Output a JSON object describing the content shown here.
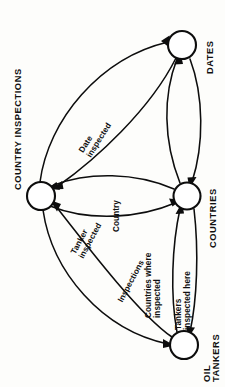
{
  "figure": {
    "orientation": "rotated-90-ccw",
    "type": "entity-relationship-network-diagram",
    "background_color": "#fdfdfb",
    "ink_color": "#0d0d0d"
  },
  "nodes": [
    {
      "id": "country-inspections",
      "label": "COUNTRY INSPECTIONS",
      "lines": [
        "COUNTRY INSPECTIONS"
      ],
      "cx": 41,
      "cy": 196,
      "r": 14
    },
    {
      "id": "dates",
      "label": "DATES",
      "lines": [
        "DATES"
      ],
      "cx": 182,
      "cy": 45,
      "r": 14
    },
    {
      "id": "countries",
      "label": "COUNTRIES",
      "lines": [
        "COUNTRIES"
      ],
      "cx": 187,
      "cy": 196,
      "r": 13.5
    },
    {
      "id": "oil-tankers",
      "label": "OIL TANKERS",
      "lines": [
        "OIL",
        "TANKERS"
      ],
      "cx": 184,
      "cy": 345,
      "r": 14
    }
  ],
  "edges": [
    {
      "id": "date-inspected",
      "label": "Date inspected",
      "lines": [
        "Date",
        "inspected"
      ],
      "from": "country-inspections",
      "to": "dates"
    },
    {
      "id": "inspections-dates",
      "label": "Inspections",
      "lines": [
        "Inspections"
      ],
      "from": "dates",
      "to": "country-inspections"
    },
    {
      "id": "country",
      "label": "Country",
      "lines": [
        "Country"
      ],
      "from": "country-inspections",
      "to": "countries"
    },
    {
      "id": "countries-where-inspected",
      "label": "Countries where inspected",
      "lines": [
        "Countries where",
        "inspected"
      ],
      "from": "oil-tankers",
      "to": "countries"
    },
    {
      "id": "tankers-inspected-here",
      "label": "Tankers inspected here",
      "lines": [
        "Tankers",
        "inspected here"
      ],
      "from": "countries",
      "to": "oil-tankers"
    },
    {
      "id": "tanker-inspected",
      "label": "Tanker inspected",
      "lines": [
        "Tanker",
        "inspected"
      ],
      "from": "country-inspections",
      "to": "oil-tankers"
    },
    {
      "id": "inspections",
      "label": "Inspections",
      "lines": [
        "Inspections"
      ],
      "from": "oil-tankers",
      "to": "country-inspections"
    }
  ],
  "labels": {
    "country_inspections": "COUNTRY INSPECTIONS",
    "dates": "DATES",
    "countries": "COUNTRIES",
    "oil_line1": "OIL",
    "oil_line2": "TANKERS",
    "date_inspected_1": "Date",
    "date_inspected_2": "inspected",
    "country": "Country",
    "tanker_inspected_1": "Tanker",
    "tanker_inspected_2": "inspected",
    "inspections": "Inspections",
    "countries_where_1": "Countries where",
    "countries_where_2": "inspected",
    "tankers_here_1": "Tankers",
    "tankers_here_2": "inspected here"
  }
}
